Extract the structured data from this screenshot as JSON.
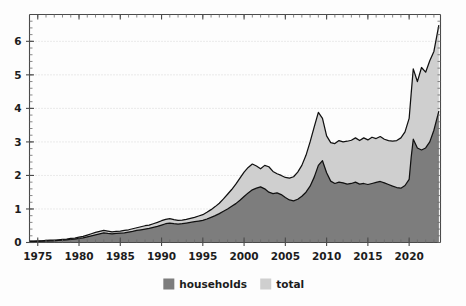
{
  "chart_data": {
    "type": "area",
    "stacked": true,
    "title": "",
    "subtitle": "",
    "xlabel": "",
    "ylabel": "",
    "xlim": [
      1974.0,
      2023.8
    ],
    "ylim": [
      0,
      6.8
    ],
    "grid": true,
    "grid_axis": "y",
    "legend": {
      "position": "bottom-center",
      "entries": [
        {
          "label": "households",
          "color": "#7d7d7d"
        },
        {
          "label": "total",
          "color": "#cfcfcf"
        }
      ]
    },
    "xticks": [
      1975,
      1980,
      1985,
      1990,
      1995,
      2000,
      2005,
      2010,
      2015,
      2020
    ],
    "xtick_labels": [
      "1975",
      "1980",
      "1985",
      "1990",
      "1995",
      "2000",
      "2005",
      "2010",
      "2015",
      "2020"
    ],
    "yticks": [
      0,
      1,
      2,
      3,
      4,
      5,
      6
    ],
    "ytick_labels": [
      "0",
      "1",
      "2",
      "3",
      "4",
      "5",
      "6"
    ],
    "x_minor_step": 1,
    "y_minor_step": 0.2,
    "x": [
      1974.0,
      1974.5,
      1975.0,
      1975.5,
      1976.0,
      1976.5,
      1977.0,
      1977.5,
      1978.0,
      1978.5,
      1979.0,
      1979.5,
      1980.0,
      1980.5,
      1981.0,
      1981.5,
      1982.0,
      1982.5,
      1983.0,
      1983.5,
      1984.0,
      1984.5,
      1985.0,
      1985.5,
      1986.0,
      1986.5,
      1987.0,
      1987.5,
      1988.0,
      1988.5,
      1989.0,
      1989.5,
      1990.0,
      1990.5,
      1991.0,
      1991.5,
      1992.0,
      1992.5,
      1993.0,
      1993.5,
      1994.0,
      1994.5,
      1995.0,
      1995.5,
      1996.0,
      1996.5,
      1997.0,
      1997.5,
      1998.0,
      1998.5,
      1999.0,
      1999.5,
      2000.0,
      2000.5,
      2001.0,
      2001.5,
      2002.0,
      2002.5,
      2003.0,
      2003.5,
      2004.0,
      2004.5,
      2005.0,
      2005.5,
      2006.0,
      2006.5,
      2007.0,
      2007.5,
      2008.0,
      2008.5,
      2009.0,
      2009.5,
      2010.0,
      2010.5,
      2011.0,
      2011.5,
      2012.0,
      2012.5,
      2013.0,
      2013.5,
      2014.0,
      2014.5,
      2015.0,
      2015.5,
      2016.0,
      2016.5,
      2017.0,
      2017.5,
      2018.0,
      2018.5,
      2019.0,
      2019.5,
      2020.0,
      2020.25,
      2020.5,
      2021.0,
      2021.5,
      2022.0,
      2022.5,
      2023.0,
      2023.6
    ],
    "series": [
      {
        "name": "households",
        "color": "#7d7d7d",
        "values": [
          0.03,
          0.03,
          0.03,
          0.04,
          0.04,
          0.05,
          0.05,
          0.06,
          0.07,
          0.08,
          0.09,
          0.1,
          0.12,
          0.14,
          0.17,
          0.2,
          0.23,
          0.26,
          0.29,
          0.27,
          0.26,
          0.27,
          0.28,
          0.29,
          0.31,
          0.33,
          0.36,
          0.38,
          0.4,
          0.42,
          0.45,
          0.48,
          0.52,
          0.56,
          0.58,
          0.56,
          0.55,
          0.56,
          0.58,
          0.6,
          0.62,
          0.64,
          0.66,
          0.7,
          0.75,
          0.8,
          0.86,
          0.93,
          1.0,
          1.08,
          1.16,
          1.26,
          1.37,
          1.48,
          1.57,
          1.62,
          1.66,
          1.6,
          1.5,
          1.46,
          1.48,
          1.43,
          1.34,
          1.27,
          1.24,
          1.29,
          1.38,
          1.5,
          1.68,
          1.95,
          2.3,
          2.44,
          2.08,
          1.83,
          1.76,
          1.8,
          1.78,
          1.74,
          1.76,
          1.8,
          1.74,
          1.76,
          1.73,
          1.76,
          1.79,
          1.82,
          1.78,
          1.73,
          1.68,
          1.64,
          1.62,
          1.7,
          1.88,
          2.55,
          3.08,
          2.82,
          2.76,
          2.82,
          3.0,
          3.35,
          3.92
        ]
      },
      {
        "name": "total",
        "color": "#cfcfcf",
        "values": [
          0.04,
          0.04,
          0.05,
          0.05,
          0.06,
          0.07,
          0.07,
          0.08,
          0.09,
          0.1,
          0.12,
          0.13,
          0.16,
          0.18,
          0.22,
          0.26,
          0.3,
          0.33,
          0.36,
          0.34,
          0.32,
          0.33,
          0.34,
          0.36,
          0.38,
          0.41,
          0.44,
          0.47,
          0.5,
          0.52,
          0.56,
          0.6,
          0.65,
          0.69,
          0.71,
          0.68,
          0.66,
          0.67,
          0.69,
          0.72,
          0.75,
          0.79,
          0.83,
          0.9,
          0.98,
          1.07,
          1.17,
          1.3,
          1.44,
          1.58,
          1.74,
          1.92,
          2.1,
          2.24,
          2.34,
          2.28,
          2.2,
          2.3,
          2.26,
          2.12,
          2.05,
          2.0,
          1.94,
          1.92,
          1.96,
          2.1,
          2.3,
          2.6,
          3.0,
          3.45,
          3.88,
          3.7,
          3.18,
          2.98,
          2.95,
          3.04,
          3.0,
          3.02,
          3.05,
          3.12,
          3.04,
          3.12,
          3.06,
          3.14,
          3.1,
          3.16,
          3.08,
          3.04,
          3.02,
          3.04,
          3.12,
          3.3,
          3.7,
          4.45,
          5.18,
          4.8,
          5.22,
          5.08,
          5.42,
          5.7,
          6.48
        ]
      }
    ]
  }
}
